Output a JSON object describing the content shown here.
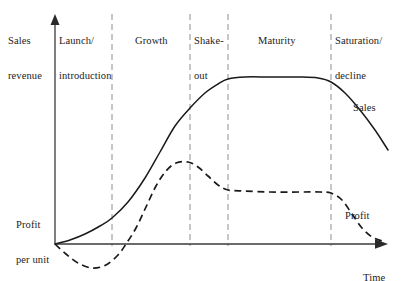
{
  "figure": {
    "type": "product-life-cycle-diagram",
    "background_color": "#ffffff",
    "line_color": "#1a1a1a",
    "divider_color": "#9a9a9a"
  },
  "axes": {
    "y_axis_label_line1": "Sales",
    "y_axis_label_line2": "revenue",
    "y_axis_secondary_line1": "Profit",
    "y_axis_secondary_line2": "per unit",
    "x_axis_label": "Time",
    "origin_x": 55,
    "origin_y": 244,
    "y_axis_top": 16,
    "x_axis_right": 386
  },
  "stages": [
    {
      "id": "launch",
      "label_line1": "Launch/",
      "label_line2": "introduction",
      "x_start": 55,
      "x_end": 112
    },
    {
      "id": "growth",
      "label_line1": "Growth",
      "label_line2": "",
      "x_start": 112,
      "x_end": 190
    },
    {
      "id": "shakeout",
      "label_line1": "Shake-",
      "label_line2": "out",
      "x_start": 190,
      "x_end": 228
    },
    {
      "id": "maturity",
      "label_line1": "Maturity",
      "label_line2": "",
      "x_start": 228,
      "x_end": 331
    },
    {
      "id": "saturation",
      "label_line1": "Saturation/",
      "label_line2": "decline",
      "x_start": 331,
      "x_end": 386
    }
  ],
  "dividers": [
    112,
    190,
    228,
    331
  ],
  "series": [
    {
      "id": "sales",
      "label": "Sales",
      "style": "solid"
    },
    {
      "id": "profit",
      "label": "Profit",
      "style": "dashed"
    }
  ],
  "chart_data": {
    "type": "line",
    "title": "",
    "xlabel": "Time",
    "ylabel": "Sales revenue / Profit per unit",
    "grid": false,
    "legend_position": "inline-right",
    "x_categories": [
      "Launch/introduction",
      "Growth",
      "Shake-out",
      "Maturity",
      "Saturation/decline"
    ],
    "series": [
      {
        "name": "Sales",
        "style": "solid",
        "points": [
          [
            55,
            244
          ],
          [
            70,
            240
          ],
          [
            85,
            234
          ],
          [
            100,
            226
          ],
          [
            112,
            218
          ],
          [
            128,
            202
          ],
          [
            145,
            178
          ],
          [
            160,
            152
          ],
          [
            175,
            126
          ],
          [
            190,
            108
          ],
          [
            205,
            93
          ],
          [
            218,
            84
          ],
          [
            228,
            79
          ],
          [
            245,
            77
          ],
          [
            270,
            77
          ],
          [
            300,
            77
          ],
          [
            318,
            78
          ],
          [
            331,
            82
          ],
          [
            345,
            93
          ],
          [
            360,
            110
          ],
          [
            375,
            130
          ],
          [
            388,
            150
          ]
        ]
      },
      {
        "name": "Profit",
        "style": "dashed",
        "points": [
          [
            55,
            244
          ],
          [
            66,
            254
          ],
          [
            78,
            263
          ],
          [
            92,
            268
          ],
          [
            106,
            265
          ],
          [
            118,
            255
          ],
          [
            126,
            244
          ],
          [
            136,
            228
          ],
          [
            146,
            207
          ],
          [
            156,
            186
          ],
          [
            166,
            171
          ],
          [
            176,
            163
          ],
          [
            188,
            162
          ],
          [
            198,
            167
          ],
          [
            208,
            176
          ],
          [
            218,
            185
          ],
          [
            228,
            190
          ],
          [
            245,
            191
          ],
          [
            270,
            192
          ],
          [
            300,
            192
          ],
          [
            320,
            192
          ],
          [
            331,
            193
          ],
          [
            342,
            200
          ],
          [
            352,
            214
          ],
          [
            362,
            228
          ],
          [
            372,
            237
          ],
          [
            382,
            241
          ]
        ]
      }
    ]
  }
}
